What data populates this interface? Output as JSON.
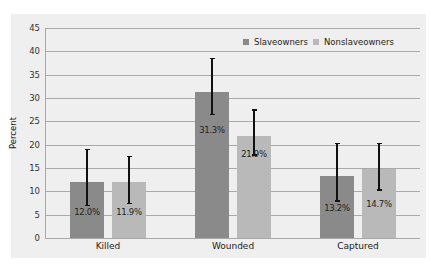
{
  "chart_data": {
    "type": "bar",
    "title": "",
    "xlabel": "",
    "ylabel": "Percent",
    "ylim": [
      0,
      45
    ],
    "yticks": [
      0,
      5,
      10,
      15,
      20,
      25,
      30,
      35,
      40,
      45
    ],
    "grid": true,
    "legend_position": "top-right (inside)",
    "categories": [
      "Killed",
      "Wounded",
      "Captured"
    ],
    "series": [
      {
        "name": "Slaveowners",
        "color": "#8a8a8a",
        "values": [
          12.0,
          31.3,
          13.2
        ],
        "labels": [
          "12.0%",
          "31.3%",
          "13.2%"
        ],
        "error_low": [
          7.0,
          26.5,
          8.0
        ],
        "error_high": [
          19.0,
          38.5,
          20.3
        ]
      },
      {
        "name": "Nonslaveowners",
        "color": "#b9b9b9",
        "values": [
          11.9,
          21.9,
          14.7
        ],
        "labels": [
          "11.9%",
          "21.9%",
          "14.7%"
        ],
        "error_low": [
          7.5,
          17.8,
          10.3
        ],
        "error_high": [
          17.5,
          27.5,
          20.3
        ]
      }
    ]
  },
  "axis": {
    "y_label": "Percent",
    "y_ticks": [
      "0",
      "5",
      "10",
      "15",
      "20",
      "25",
      "30",
      "35",
      "40",
      "45"
    ]
  },
  "legend": {
    "items": [
      {
        "label": "Slaveowners",
        "color": "#8a8a8a"
      },
      {
        "label": "Nonslaveowners",
        "color": "#b9b9b9"
      }
    ]
  }
}
